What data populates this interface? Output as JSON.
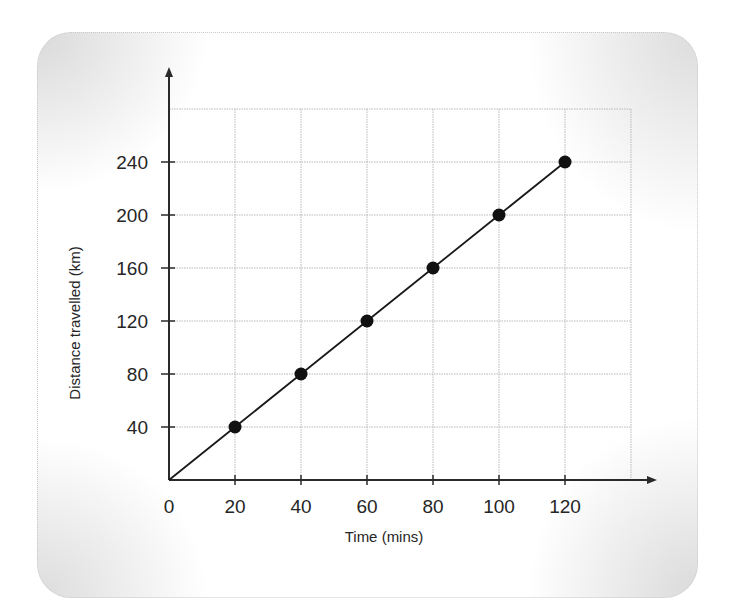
{
  "chart_data": {
    "type": "line",
    "title": "",
    "xlabel": "Time (mins)",
    "ylabel": "Distance travelled (km)",
    "x": [
      0,
      20,
      40,
      60,
      80,
      100,
      120
    ],
    "series": [
      {
        "name": "Distance",
        "values": [
          0,
          40,
          80,
          120,
          160,
          200,
          240
        ],
        "markers": [
          false,
          true,
          true,
          true,
          true,
          true,
          true
        ]
      }
    ],
    "x_ticks": [
      "0",
      "20",
      "40",
      "60",
      "80",
      "100",
      "120"
    ],
    "y_ticks": [
      "40",
      "80",
      "120",
      "160",
      "200",
      "240"
    ],
    "xlim": [
      0,
      140
    ],
    "ylim": [
      0,
      280
    ],
    "grid": true,
    "legend": null
  },
  "colors": {
    "line": "#1a1a1a",
    "marker": "#111111",
    "grid": "#b8b8b8",
    "axis": "#2a2a2a"
  }
}
